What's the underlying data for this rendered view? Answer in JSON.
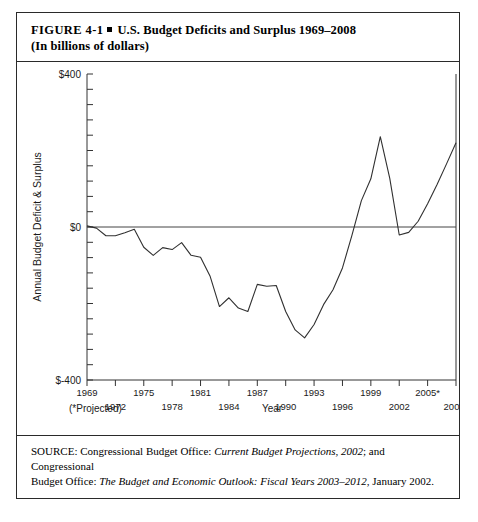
{
  "figure": {
    "number": "FIGURE  4-1",
    "bullet": "square-bullet",
    "title": "U.S. Budget Deficits and Surplus 1969–2008",
    "subtitle": "(In billions of dollars)"
  },
  "source": {
    "line1_prefix": "SOURCE: Congressional Budget Office: ",
    "line1_italic": "Current Budget Projections, 2002",
    "line1_suffix": "; and Congressional",
    "line2_prefix": "Budget Office: ",
    "line2_italic": "The Budget and Economic Outlook: Fiscal Years 2003–2012",
    "line2_suffix": ", January 2002."
  },
  "footnotes": {
    "projected_note": "(*Projected)"
  },
  "chart_data": {
    "type": "line",
    "title": "U.S. Budget Deficits and Surplus 1969–2008",
    "subtitle": "(In billions of dollars)",
    "xlabel": "Year",
    "ylabel": "Annual Budget Deficit & Surplus",
    "ylim": [
      -400,
      400
    ],
    "xlim": [
      1969,
      2008
    ],
    "grid": false,
    "legend": false,
    "y_ticklabels": [
      "$400",
      "$0",
      "$-400"
    ],
    "y_ticklabel_values": [
      400,
      0,
      -400
    ],
    "y_minor_tick_step": 40,
    "x_ticklabels_top": [
      "1969",
      "1975",
      "1981",
      "1987",
      "1993",
      "1999",
      "2005*"
    ],
    "x_ticklabel_top_values": [
      1969,
      1975,
      1981,
      1987,
      1993,
      1999,
      2005
    ],
    "x_ticklabels_bottom": [
      "1972",
      "1978",
      "1984",
      "1990",
      "1996",
      "2002",
      "2008*"
    ],
    "x_ticklabel_bottom_values": [
      1972,
      1978,
      1984,
      1990,
      1996,
      2002,
      2008
    ],
    "x_tick_step": 3,
    "zero_reference_line": 0,
    "series": [
      {
        "name": "Annual Budget Deficit & Surplus",
        "color": "#303030",
        "x": [
          1969,
          1970,
          1971,
          1972,
          1973,
          1974,
          1975,
          1976,
          1977,
          1978,
          1979,
          1980,
          1981,
          1982,
          1983,
          1984,
          1985,
          1986,
          1987,
          1988,
          1989,
          1990,
          1991,
          1992,
          1993,
          1994,
          1995,
          1996,
          1997,
          1998,
          1999,
          2000,
          2001,
          2002,
          2003,
          2004,
          2005,
          2006,
          2007,
          2008
        ],
        "values": [
          3,
          -3,
          -23,
          -23,
          -15,
          -6,
          -53,
          -74,
          -54,
          -59,
          -41,
          -74,
          -79,
          -128,
          -208,
          -185,
          -212,
          -221,
          -150,
          -155,
          -153,
          -221,
          -269,
          -290,
          -255,
          -203,
          -164,
          -107,
          -22,
          69,
          126,
          236,
          127,
          -21,
          -14,
          15,
          61,
          111,
          165,
          220
        ]
      }
    ]
  }
}
